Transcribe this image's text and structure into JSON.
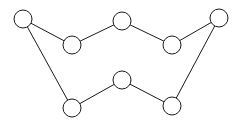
{
  "figure": {
    "kind": "undirected-graph-diagram",
    "title": "",
    "width": 242,
    "height": 125,
    "background_color": "#ffffff",
    "stroke_color": "#1a1a1a",
    "node_fill_color": "#ffffff",
    "node_radius": 9,
    "stroke_width": 1
  },
  "graph": {
    "node_count": 8,
    "edge_count": 8,
    "nodes": [
      {
        "id": "n1",
        "label": "",
        "x": 23,
        "y": 19,
        "r": 9
      },
      {
        "id": "n2",
        "label": "",
        "x": 72,
        "y": 45,
        "r": 9
      },
      {
        "id": "n3",
        "label": "",
        "x": 122,
        "y": 21,
        "r": 9
      },
      {
        "id": "n4",
        "label": "",
        "x": 172,
        "y": 45,
        "r": 9
      },
      {
        "id": "n5",
        "label": "",
        "x": 219,
        "y": 18,
        "r": 9
      },
      {
        "id": "n6",
        "label": "",
        "x": 172,
        "y": 106,
        "r": 9
      },
      {
        "id": "n7",
        "label": "",
        "x": 122,
        "y": 80,
        "r": 9
      },
      {
        "id": "n8",
        "label": "",
        "x": 72,
        "y": 108,
        "r": 9
      }
    ],
    "edges": [
      {
        "id": "e1",
        "source": "n1",
        "target": "n2"
      },
      {
        "id": "e2",
        "source": "n2",
        "target": "n3"
      },
      {
        "id": "e3",
        "source": "n3",
        "target": "n4"
      },
      {
        "id": "e4",
        "source": "n4",
        "target": "n5"
      },
      {
        "id": "e5",
        "source": "n5",
        "target": "n6"
      },
      {
        "id": "e6",
        "source": "n6",
        "target": "n7"
      },
      {
        "id": "e7",
        "source": "n7",
        "target": "n8"
      },
      {
        "id": "e8",
        "source": "n8",
        "target": "n1"
      }
    ]
  }
}
